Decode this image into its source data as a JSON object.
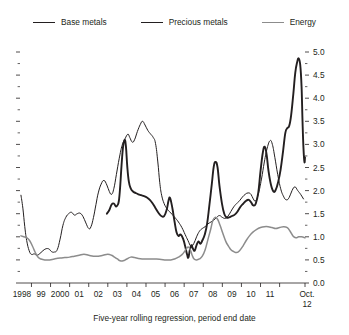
{
  "figure": {
    "caption": "Five-year rolling regression, period end date",
    "background": "#ffffff"
  },
  "legend": {
    "position": "top-center",
    "items": [
      {
        "label": "Base metals",
        "color": "#231f20",
        "width": 1.0,
        "icon": "line-swatch-icon"
      },
      {
        "label": "Precious metals",
        "color": "#231f20",
        "width": 1.9,
        "icon": "line-swatch-icon"
      },
      {
        "label": "Energy",
        "color": "#8c8c8c",
        "width": 1.5,
        "icon": "line-swatch-icon"
      }
    ]
  },
  "chart_data": {
    "type": "line",
    "title": "",
    "subtitle": "",
    "xlabel": "Five-year rolling regression, period end date",
    "ylabel": "",
    "grid": false,
    "y_axis_side": "right",
    "ylim": [
      0.0,
      5.0
    ],
    "ytick_labels": [
      "0.0",
      "0.5",
      "1.0",
      "1.5",
      "2.0",
      "2.5",
      "3.0",
      "3.5",
      "4.0",
      "4.5",
      "5.0"
    ],
    "yticks": [
      0.0,
      0.5,
      1.0,
      1.5,
      2.0,
      2.5,
      3.0,
      3.5,
      4.0,
      4.5,
      5.0
    ],
    "yminor_step": 0.25,
    "xlim": [
      1997.9,
      2012.83
    ],
    "xtick_labels": [
      "1998",
      "99",
      "2000",
      "01",
      "02",
      "03",
      "04",
      "05",
      "06",
      "07",
      "08",
      "09",
      "10",
      "11",
      "Oct.\n12"
    ],
    "xtick_label_last_line1": "Oct.",
    "xtick_label_last_line2": "12",
    "xticks": [
      1998,
      1999,
      2000,
      2001,
      2002,
      2003,
      2004,
      2005,
      2006,
      2007,
      2008,
      2009,
      2010,
      2011,
      2012.83
    ],
    "series": [
      {
        "name": "Base metals",
        "color": "#231f20",
        "width": 1.0,
        "points": [
          [
            1997.95,
            1.9
          ],
          [
            1998.05,
            1.62
          ],
          [
            1998.15,
            1.22
          ],
          [
            1998.25,
            0.92
          ],
          [
            1998.38,
            0.7
          ],
          [
            1998.5,
            0.62
          ],
          [
            1998.65,
            0.63
          ],
          [
            1998.8,
            0.6
          ],
          [
            1999.0,
            0.66
          ],
          [
            1999.2,
            0.73
          ],
          [
            1999.4,
            0.74
          ],
          [
            1999.55,
            0.68
          ],
          [
            1999.7,
            0.67
          ],
          [
            1999.85,
            0.72
          ],
          [
            2000.0,
            0.95
          ],
          [
            2000.15,
            1.25
          ],
          [
            2000.3,
            1.42
          ],
          [
            2000.45,
            1.5
          ],
          [
            2000.6,
            1.53
          ],
          [
            2000.75,
            1.47
          ],
          [
            2000.9,
            1.5
          ],
          [
            2001.05,
            1.51
          ],
          [
            2001.2,
            1.44
          ],
          [
            2001.35,
            1.3
          ],
          [
            2001.5,
            1.18
          ],
          [
            2001.62,
            1.22
          ],
          [
            2001.75,
            1.42
          ],
          [
            2001.88,
            1.7
          ],
          [
            2002.0,
            1.95
          ],
          [
            2002.15,
            2.14
          ],
          [
            2002.3,
            2.22
          ],
          [
            2002.45,
            2.12
          ],
          [
            2002.58,
            1.98
          ],
          [
            2002.7,
            1.92
          ],
          [
            2002.82,
            2.05
          ],
          [
            2002.95,
            2.35
          ],
          [
            2003.1,
            2.7
          ],
          [
            2003.25,
            2.98
          ],
          [
            2003.4,
            3.12
          ],
          [
            2003.55,
            3.22
          ],
          [
            2003.65,
            3.15
          ],
          [
            2003.78,
            3.05
          ],
          [
            2003.9,
            3.1
          ],
          [
            2004.05,
            3.28
          ],
          [
            2004.2,
            3.43
          ],
          [
            2004.32,
            3.5
          ],
          [
            2004.45,
            3.42
          ],
          [
            2004.6,
            3.3
          ],
          [
            2004.75,
            3.22
          ],
          [
            2004.88,
            3.15
          ],
          [
            2005.0,
            3.02
          ],
          [
            2005.12,
            2.62
          ],
          [
            2005.22,
            2.18
          ],
          [
            2005.32,
            1.9
          ],
          [
            2005.45,
            1.72
          ],
          [
            2005.58,
            1.62
          ],
          [
            2005.72,
            1.55
          ],
          [
            2005.88,
            1.48
          ],
          [
            2006.05,
            1.4
          ],
          [
            2006.2,
            1.32
          ],
          [
            2006.38,
            1.2
          ],
          [
            2006.55,
            1.05
          ],
          [
            2006.7,
            0.92
          ],
          [
            2006.85,
            0.8
          ],
          [
            2007.0,
            0.85
          ],
          [
            2007.15,
            1.0
          ],
          [
            2007.3,
            1.12
          ],
          [
            2007.45,
            1.18
          ],
          [
            2007.6,
            1.22
          ],
          [
            2007.75,
            1.28
          ],
          [
            2007.9,
            1.32
          ],
          [
            2008.05,
            1.36
          ],
          [
            2008.2,
            1.42
          ],
          [
            2008.35,
            1.46
          ],
          [
            2008.5,
            1.42
          ],
          [
            2008.65,
            1.4
          ],
          [
            2008.8,
            1.45
          ],
          [
            2008.95,
            1.55
          ],
          [
            2009.1,
            1.65
          ],
          [
            2009.25,
            1.72
          ],
          [
            2009.4,
            1.78
          ],
          [
            2009.55,
            1.86
          ],
          [
            2009.7,
            1.92
          ],
          [
            2009.85,
            1.95
          ],
          [
            2010.0,
            1.92
          ],
          [
            2010.12,
            1.82
          ],
          [
            2010.25,
            1.78
          ],
          [
            2010.4,
            1.95
          ],
          [
            2010.55,
            2.25
          ],
          [
            2010.7,
            2.62
          ],
          [
            2010.85,
            2.92
          ],
          [
            2011.0,
            3.08
          ],
          [
            2011.12,
            3.0
          ],
          [
            2011.25,
            2.72
          ],
          [
            2011.4,
            2.35
          ],
          [
            2011.55,
            2.05
          ],
          [
            2011.7,
            1.88
          ],
          [
            2011.85,
            1.8
          ],
          [
            2012.0,
            1.85
          ],
          [
            2012.15,
            2.0
          ],
          [
            2012.3,
            2.08
          ],
          [
            2012.45,
            2.0
          ],
          [
            2012.6,
            1.92
          ],
          [
            2012.75,
            1.82
          ]
        ]
      },
      {
        "name": "Precious metals",
        "color": "#231f20",
        "width": 1.9,
        "points": [
          [
            2002.45,
            1.5
          ],
          [
            2002.58,
            1.58
          ],
          [
            2002.7,
            1.7
          ],
          [
            2002.82,
            1.72
          ],
          [
            2002.92,
            1.66
          ],
          [
            2003.0,
            1.68
          ],
          [
            2003.08,
            1.78
          ],
          [
            2003.15,
            2.1
          ],
          [
            2003.22,
            2.55
          ],
          [
            2003.3,
            2.95
          ],
          [
            2003.38,
            3.1
          ],
          [
            2003.45,
            2.95
          ],
          [
            2003.52,
            2.52
          ],
          [
            2003.6,
            2.2
          ],
          [
            2003.7,
            2.05
          ],
          [
            2003.82,
            1.98
          ],
          [
            2003.95,
            1.95
          ],
          [
            2004.1,
            1.92
          ],
          [
            2004.25,
            1.9
          ],
          [
            2004.4,
            1.88
          ],
          [
            2004.55,
            1.85
          ],
          [
            2004.7,
            1.8
          ],
          [
            2004.85,
            1.72
          ],
          [
            2005.0,
            1.62
          ],
          [
            2005.15,
            1.52
          ],
          [
            2005.3,
            1.45
          ],
          [
            2005.45,
            1.45
          ],
          [
            2005.58,
            1.58
          ],
          [
            2005.68,
            1.78
          ],
          [
            2005.75,
            1.85
          ],
          [
            2005.82,
            1.75
          ],
          [
            2005.9,
            1.58
          ],
          [
            2006.0,
            1.32
          ],
          [
            2006.1,
            1.1
          ],
          [
            2006.2,
            1.02
          ],
          [
            2006.32,
            1.05
          ],
          [
            2006.45,
            0.95
          ],
          [
            2006.55,
            0.8
          ],
          [
            2006.65,
            0.62
          ],
          [
            2006.72,
            0.55
          ],
          [
            2006.8,
            0.72
          ],
          [
            2006.88,
            0.82
          ],
          [
            2006.95,
            0.75
          ],
          [
            2007.05,
            0.7
          ],
          [
            2007.15,
            0.82
          ],
          [
            2007.25,
            0.9
          ],
          [
            2007.35,
            0.85
          ],
          [
            2007.45,
            0.92
          ],
          [
            2007.58,
            1.05
          ],
          [
            2007.7,
            1.28
          ],
          [
            2007.82,
            1.68
          ],
          [
            2007.95,
            2.15
          ],
          [
            2008.05,
            2.52
          ],
          [
            2008.15,
            2.62
          ],
          [
            2008.25,
            2.5
          ],
          [
            2008.35,
            2.1
          ],
          [
            2008.48,
            1.72
          ],
          [
            2008.6,
            1.5
          ],
          [
            2008.72,
            1.42
          ],
          [
            2008.85,
            1.42
          ],
          [
            2009.0,
            1.45
          ],
          [
            2009.15,
            1.48
          ],
          [
            2009.3,
            1.55
          ],
          [
            2009.45,
            1.65
          ],
          [
            2009.6,
            1.72
          ],
          [
            2009.75,
            1.78
          ],
          [
            2009.88,
            1.8
          ],
          [
            2010.0,
            1.75
          ],
          [
            2010.12,
            1.68
          ],
          [
            2010.25,
            1.72
          ],
          [
            2010.38,
            1.95
          ],
          [
            2010.5,
            2.42
          ],
          [
            2010.62,
            2.82
          ],
          [
            2010.72,
            2.95
          ],
          [
            2010.82,
            2.78
          ],
          [
            2010.92,
            2.42
          ],
          [
            2011.05,
            2.12
          ],
          [
            2011.18,
            1.98
          ],
          [
            2011.3,
            2.02
          ],
          [
            2011.42,
            2.18
          ],
          [
            2011.55,
            2.45
          ],
          [
            2011.68,
            2.85
          ],
          [
            2011.8,
            3.25
          ],
          [
            2011.9,
            3.35
          ],
          [
            2012.0,
            3.4
          ],
          [
            2012.1,
            3.62
          ],
          [
            2012.22,
            4.1
          ],
          [
            2012.32,
            4.55
          ],
          [
            2012.42,
            4.78
          ],
          [
            2012.5,
            4.86
          ],
          [
            2012.58,
            4.72
          ],
          [
            2012.65,
            4.25
          ],
          [
            2012.7,
            3.5
          ],
          [
            2012.75,
            2.92
          ],
          [
            2012.8,
            2.62
          ],
          [
            2012.83,
            2.72
          ]
        ]
      },
      {
        "name": "Energy",
        "color": "#8c8c8c",
        "width": 1.5,
        "points": [
          [
            1997.95,
            1.02
          ],
          [
            1998.1,
            1.0
          ],
          [
            1998.25,
            0.98
          ],
          [
            1998.4,
            0.92
          ],
          [
            1998.55,
            0.8
          ],
          [
            1998.7,
            0.66
          ],
          [
            1998.85,
            0.56
          ],
          [
            1999.0,
            0.52
          ],
          [
            1999.2,
            0.5
          ],
          [
            1999.45,
            0.5
          ],
          [
            1999.7,
            0.52
          ],
          [
            2000.0,
            0.54
          ],
          [
            2000.25,
            0.55
          ],
          [
            2000.5,
            0.56
          ],
          [
            2000.75,
            0.58
          ],
          [
            2001.0,
            0.6
          ],
          [
            2001.25,
            0.62
          ],
          [
            2001.5,
            0.6
          ],
          [
            2001.75,
            0.58
          ],
          [
            2002.0,
            0.58
          ],
          [
            2002.25,
            0.6
          ],
          [
            2002.5,
            0.62
          ],
          [
            2002.7,
            0.6
          ],
          [
            2002.85,
            0.56
          ],
          [
            2003.0,
            0.52
          ],
          [
            2003.15,
            0.48
          ],
          [
            2003.3,
            0.48
          ],
          [
            2003.5,
            0.52
          ],
          [
            2003.7,
            0.56
          ],
          [
            2003.9,
            0.55
          ],
          [
            2004.1,
            0.53
          ],
          [
            2004.3,
            0.52
          ],
          [
            2004.55,
            0.52
          ],
          [
            2004.8,
            0.52
          ],
          [
            2005.05,
            0.52
          ],
          [
            2005.3,
            0.51
          ],
          [
            2005.55,
            0.5
          ],
          [
            2005.8,
            0.5
          ],
          [
            2006.0,
            0.52
          ],
          [
            2006.2,
            0.56
          ],
          [
            2006.4,
            0.62
          ],
          [
            2006.55,
            0.7
          ],
          [
            2006.7,
            0.78
          ],
          [
            2006.82,
            0.72
          ],
          [
            2006.92,
            0.6
          ],
          [
            2007.02,
            0.52
          ],
          [
            2007.15,
            0.5
          ],
          [
            2007.3,
            0.52
          ],
          [
            2007.45,
            0.58
          ],
          [
            2007.6,
            0.72
          ],
          [
            2007.75,
            0.95
          ],
          [
            2007.9,
            1.18
          ],
          [
            2008.0,
            1.35
          ],
          [
            2008.12,
            1.42
          ],
          [
            2008.25,
            1.38
          ],
          [
            2008.38,
            1.25
          ],
          [
            2008.52,
            1.08
          ],
          [
            2008.68,
            0.9
          ],
          [
            2008.82,
            0.8
          ],
          [
            2008.95,
            0.72
          ],
          [
            2009.1,
            0.68
          ],
          [
            2009.25,
            0.66
          ],
          [
            2009.4,
            0.7
          ],
          [
            2009.58,
            0.8
          ],
          [
            2009.75,
            0.92
          ],
          [
            2009.92,
            1.02
          ],
          [
            2010.1,
            1.1
          ],
          [
            2010.3,
            1.16
          ],
          [
            2010.5,
            1.2
          ],
          [
            2010.7,
            1.22
          ],
          [
            2010.9,
            1.22
          ],
          [
            2011.1,
            1.2
          ],
          [
            2011.3,
            1.18
          ],
          [
            2011.5,
            1.2
          ],
          [
            2011.7,
            1.22
          ],
          [
            2011.9,
            1.2
          ],
          [
            2012.05,
            1.12
          ],
          [
            2012.2,
            1.02
          ],
          [
            2012.35,
            0.98
          ],
          [
            2012.5,
            1.0
          ],
          [
            2012.65,
            1.0
          ],
          [
            2012.83,
            0.98
          ]
        ]
      }
    ]
  }
}
